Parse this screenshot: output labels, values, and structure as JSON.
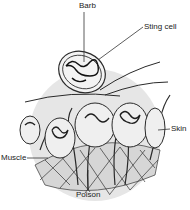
{
  "diagram": {
    "labels": {
      "barb": "Barb",
      "sting_cell": "Sting cell",
      "skin": "Skin",
      "muscle": "Muscle",
      "poison": "Poison"
    },
    "colors": {
      "line": "#2a2a2a",
      "circle_fill": "#e9e9e9",
      "background": "#ffffff"
    }
  }
}
